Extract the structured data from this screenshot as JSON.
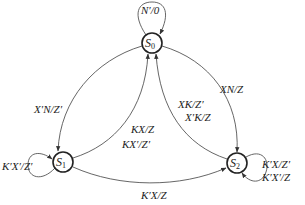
{
  "diagram": {
    "type": "state-transition",
    "states": [
      {
        "id": "S0",
        "name": "S",
        "sub": "0",
        "x": 152,
        "y": 43
      },
      {
        "id": "S1",
        "name": "S",
        "sub": "1",
        "x": 63,
        "y": 162
      },
      {
        "id": "S2",
        "name": "S",
        "sub": "2",
        "x": 237,
        "y": 163
      }
    ],
    "transitions": [
      {
        "from": "S0",
        "to": "S0",
        "label": "N′/0"
      },
      {
        "from": "S0",
        "to": "S1",
        "label": "X′N/Z′"
      },
      {
        "from": "S1",
        "to": "S0",
        "label_1": "KX/Z",
        "label_2": "KX′/Z′"
      },
      {
        "from": "S2",
        "to": "S0",
        "label_1": "XK/Z′",
        "label_2": "X′K/Z"
      },
      {
        "from": "S0",
        "to": "S2",
        "label": "XN/Z"
      },
      {
        "from": "S1",
        "to": "S1",
        "label": "K′X′/Z′"
      },
      {
        "from": "S1",
        "to": "S2",
        "label": "K′X/Z"
      },
      {
        "from": "S2",
        "to": "S2",
        "label_1": "K′X/Z′",
        "label_2": "K′X′/Z"
      }
    ]
  }
}
